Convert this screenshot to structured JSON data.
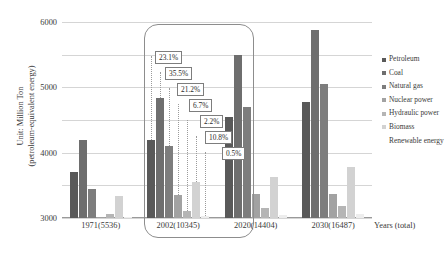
{
  "axes": {
    "ylabel_line1": "Unit: Million Ton",
    "ylabel_line2": "(petroleum-equivalent energy)",
    "xlabel": "Years (total)"
  },
  "legend": {
    "items": [
      {
        "label": "Petroleum",
        "color": "#595959"
      },
      {
        "label": "Coal",
        "color": "#6e6e6e"
      },
      {
        "label": "Natural gas",
        "color": "#7d7d7d"
      },
      {
        "label": "Nuclear power",
        "color": "#a2a2a2"
      },
      {
        "label": "Hydraulic power",
        "color": "#b5b5b5"
      },
      {
        "label": "Biomass",
        "color": "#d2d2d2"
      },
      {
        "label": "Renewable energy",
        "color": "#ededed"
      }
    ]
  },
  "callouts": [
    {
      "text": "23.1%"
    },
    {
      "text": "35.5%"
    },
    {
      "text": "21.2%"
    },
    {
      "text": "6.7%"
    },
    {
      "text": "2.2%"
    },
    {
      "text": "10.8%"
    },
    {
      "text": "0.5%"
    }
  ],
  "chart_data": {
    "type": "bar",
    "title": "",
    "xlabel": "Years (total)",
    "ylabel": "Unit: Million Ton (petroleum-equivalent energy)",
    "ylim": [
      0,
      6000
    ],
    "yticks": [
      0,
      1000,
      2000,
      3000,
      4000,
      5000,
      6000
    ],
    "grid": true,
    "legend_position": "right",
    "categories": [
      "1971(5536)",
      "2002(10345)",
      "2020(14404)",
      "2030(16487)"
    ],
    "category_totals": [
      5536,
      10345,
      14404,
      16487
    ],
    "series": [
      {
        "name": "Petroleum",
        "values": [
          1400,
          2390,
          3100,
          3550
        ]
      },
      {
        "name": "Coal",
        "values": [
          2400,
          3672,
          5000,
          5750
        ]
      },
      {
        "name": "Natural gas",
        "values": [
          900,
          2193,
          3400,
          4100
        ]
      },
      {
        "name": "Nuclear power",
        "values": [
          20,
          693,
          750,
          720
        ]
      },
      {
        "name": "Hydraulic power",
        "values": [
          110,
          228,
          320,
          370
        ]
      },
      {
        "name": "Biomass",
        "values": [
          680,
          1117,
          1250,
          1550
        ]
      },
      {
        "name": "Renewable energy",
        "values": [
          10,
          52,
          80,
          120
        ]
      }
    ],
    "annotations": {
      "highlighted_category": "2002(10345)",
      "share_labels": [
        "23.1%",
        "35.5%",
        "21.2%",
        "6.7%",
        "2.2%",
        "10.8%",
        "0.5%"
      ]
    }
  }
}
